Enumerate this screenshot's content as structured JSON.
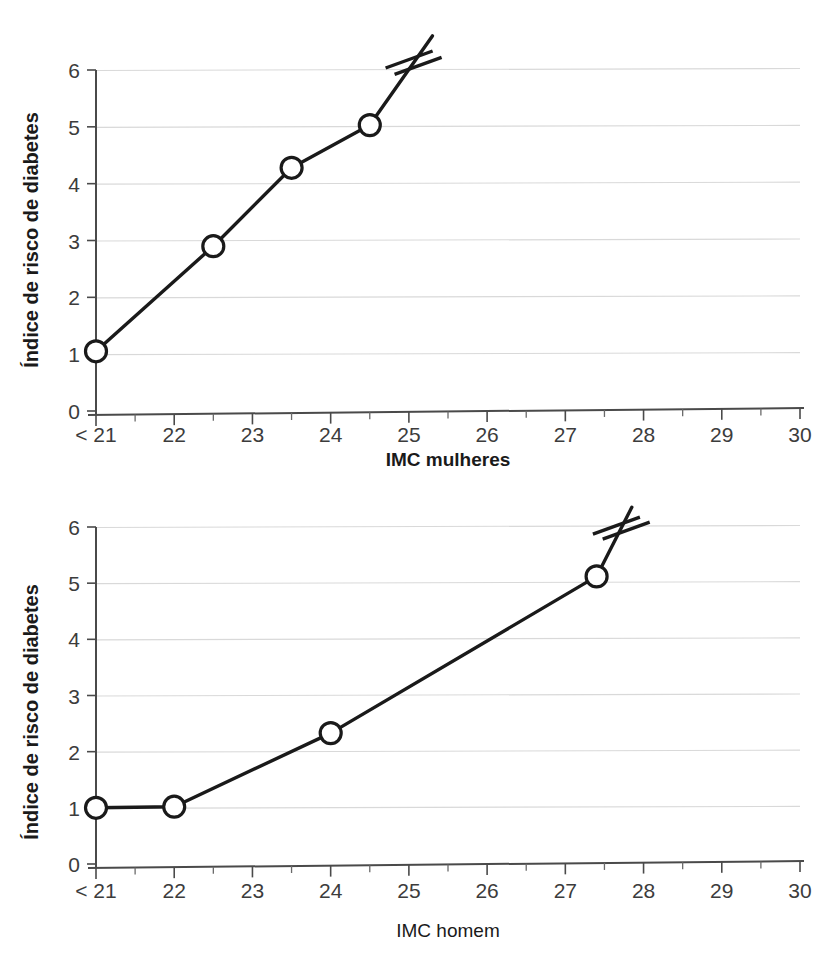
{
  "page": {
    "background_color": "#ffffff",
    "ink_color": "#1a1a1a",
    "gridline_color": "#d9d9d9",
    "axis_color": "#4a4a4a"
  },
  "figures": [
    {
      "id": "women",
      "name": "diabetes-risk-vs-bmi-women",
      "ylabel": "Índice de risco de diabetes",
      "xlabel": "IMC mulheres",
      "xlabel_bold": true,
      "y_ticks": [
        "0",
        "1",
        "2",
        "3",
        "4",
        "5",
        "6"
      ],
      "x_ticks": [
        "< 21",
        "22",
        "23",
        "24",
        "25",
        "26",
        "27",
        "28",
        "29",
        "30"
      ],
      "break_marker": "axis-break-slashes"
    },
    {
      "id": "men",
      "name": "diabetes-risk-vs-bmi-men",
      "ylabel": "Índice de risco de diabetes",
      "xlabel": "IMC homem",
      "xlabel_bold": false,
      "y_ticks": [
        "0",
        "1",
        "2",
        "3",
        "4",
        "5",
        "6"
      ],
      "x_ticks": [
        "< 21",
        "22",
        "23",
        "24",
        "25",
        "26",
        "27",
        "28",
        "29",
        "30"
      ],
      "break_marker": "axis-break-slashes"
    }
  ],
  "chart_data": [
    {
      "type": "line",
      "title": "",
      "xlabel": "IMC mulheres",
      "ylabel": "Índice de risco de diabetes",
      "x_tick_labels": [
        "< 21",
        "22",
        "23",
        "24",
        "25",
        "26",
        "27",
        "28",
        "29",
        "30"
      ],
      "x_tick_values": [
        21,
        22,
        23,
        24,
        25,
        26,
        27,
        28,
        29,
        30
      ],
      "y_tick_labels": [
        "0",
        "1",
        "2",
        "3",
        "4",
        "5",
        "6"
      ],
      "xlim": [
        21,
        30
      ],
      "ylim": [
        0,
        6
      ],
      "grid": "horizontal",
      "legend": "none",
      "markers": "open-circle",
      "x": [
        21.0,
        22.5,
        23.5,
        24.5
      ],
      "values": [
        1.05,
        2.9,
        4.28,
        5.03
      ],
      "continuation_to": {
        "x": 25.3,
        "y": 6.6,
        "note": "line continues past axis break"
      },
      "annotations": [
        "axis break (double slash) on the rising line above the last point"
      ]
    },
    {
      "type": "line",
      "title": "",
      "xlabel": "IMC homem",
      "ylabel": "Índice de risco de diabetes",
      "x_tick_labels": [
        "< 21",
        "22",
        "23",
        "24",
        "25",
        "26",
        "27",
        "28",
        "29",
        "30"
      ],
      "x_tick_values": [
        21,
        22,
        23,
        24,
        25,
        26,
        27,
        28,
        29,
        30
      ],
      "y_tick_labels": [
        "0",
        "1",
        "2",
        "3",
        "4",
        "5",
        "6"
      ],
      "xlim": [
        21,
        30
      ],
      "ylim": [
        0,
        6
      ],
      "grid": "horizontal",
      "legend": "none",
      "markers": "open-circle",
      "x": [
        21.0,
        22.0,
        24.0,
        27.4
      ],
      "values": [
        1.0,
        1.02,
        2.33,
        5.12
      ],
      "continuation_to": {
        "x": 27.85,
        "y": 6.35,
        "note": "line continues past axis break"
      },
      "annotations": [
        "axis break (double slash) on the rising line above the last point"
      ]
    }
  ]
}
